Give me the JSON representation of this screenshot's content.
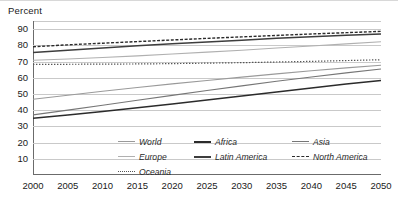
{
  "axis_title": "Percent",
  "chart_data": {
    "type": "line",
    "title": "Percent",
    "xlabel": "",
    "ylabel": "Percent",
    "x": [
      2000,
      2005,
      2010,
      2015,
      2020,
      2025,
      2030,
      2035,
      2040,
      2045,
      2050
    ],
    "xlim": [
      2000,
      2050
    ],
    "ylim": [
      0,
      95
    ],
    "yticks": [
      10,
      20,
      30,
      40,
      50,
      60,
      70,
      80,
      90
    ],
    "xticks": [
      "2000",
      "2005",
      "2010",
      "2015",
      "2020",
      "2025",
      "2030",
      "2035",
      "2040",
      "2045",
      "2050"
    ],
    "grid": true,
    "legend_position": "inside-bottom",
    "series": [
      {
        "name": "World",
        "style": "solid",
        "color": "#9a9a9a",
        "width": 1.1,
        "values": [
          46.7,
          49.2,
          51.7,
          54.0,
          56.2,
          58.3,
          60.4,
          62.4,
          64.3,
          66.1,
          67.7
        ]
      },
      {
        "name": "Africa",
        "style": "solid",
        "color": "#2b2b2b",
        "width": 1.5,
        "values": [
          35.0,
          37.0,
          39.2,
          41.5,
          43.8,
          46.2,
          48.7,
          51.2,
          53.7,
          56.1,
          58.3
        ]
      },
      {
        "name": "Asia",
        "style": "solid",
        "color": "#767676",
        "width": 1.1,
        "values": [
          37.1,
          40.0,
          43.0,
          46.1,
          49.1,
          52.1,
          55.0,
          57.8,
          60.5,
          63.0,
          65.4
        ]
      },
      {
        "name": "Europe",
        "style": "solid",
        "color": "#b0b0b0",
        "width": 1.1,
        "values": [
          70.8,
          71.6,
          72.5,
          73.5,
          74.6,
          75.8,
          77.0,
          78.3,
          79.6,
          80.9,
          82.2
        ]
      },
      {
        "name": "Latin America",
        "style": "solid",
        "color": "#3d3d3d",
        "width": 1.5,
        "values": [
          75.5,
          77.0,
          78.4,
          79.7,
          80.9,
          82.1,
          83.2,
          84.3,
          85.3,
          86.2,
          87.0
        ]
      },
      {
        "name": "North America",
        "style": "dashed",
        "color": "#2b2b2b",
        "width": 1.4,
        "values": [
          79.1,
          80.3,
          81.3,
          82.3,
          83.3,
          84.3,
          85.2,
          86.1,
          87.0,
          87.8,
          88.6
        ]
      },
      {
        "name": "Oceania",
        "style": "dotted",
        "color": "#555555",
        "width": 1.2,
        "values": [
          68.3,
          68.3,
          68.4,
          68.5,
          68.7,
          69.0,
          69.3,
          69.7,
          70.1,
          70.6,
          71.1
        ]
      }
    ]
  },
  "legend": {
    "items": [
      {
        "label": "World",
        "style": "solid",
        "color": "#9a9a9a",
        "width": 1.4
      },
      {
        "label": "Africa",
        "style": "solid",
        "color": "#2b2b2b",
        "width": 2.0
      },
      {
        "label": "Asia",
        "style": "solid",
        "color": "#767676",
        "width": 1.4
      },
      {
        "label": "Europe",
        "style": "solid",
        "color": "#b0b0b0",
        "width": 1.4
      },
      {
        "label": "Latin America",
        "style": "solid",
        "color": "#3d3d3d",
        "width": 2.0
      },
      {
        "label": "North America",
        "style": "dashed",
        "color": "#2b2b2b",
        "width": 1.6
      },
      {
        "label": "Oceania",
        "style": "dotted",
        "color": "#555555",
        "width": 1.6
      }
    ]
  }
}
